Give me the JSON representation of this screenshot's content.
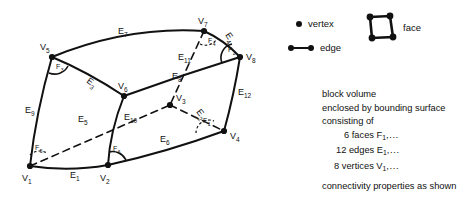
{
  "legend": {
    "vertex_label": "vertex",
    "edge_label": "edge",
    "face_label": "face",
    "vertex_icon": "filled-dot-icon",
    "edge_icon": "dot-line-dot-icon",
    "face_icon": "quadrilateral-face-icon"
  },
  "notes": {
    "line1": "block volume",
    "line2": "enclosed by bounding surface",
    "line3": "consisting of",
    "faces_count": "6 faces F",
    "faces_sub": "1",
    "faces_tail": ",...",
    "edges_count": "12 edges E",
    "edges_sub": "1",
    "edges_tail": ",...",
    "vertices_count": "8 vertices V",
    "vertices_sub": "1",
    "vertices_tail": ",...",
    "line_last": "connectivity properties as shown"
  },
  "diagram": {
    "vertices": [
      {
        "id": "V1",
        "base": "V",
        "sub": "1",
        "x": 30,
        "y": 166,
        "lx": 22,
        "ly": 181,
        "hidden": false
      },
      {
        "id": "V2",
        "base": "V",
        "sub": "2",
        "x": 108,
        "y": 165,
        "lx": 100,
        "ly": 181,
        "hidden": false
      },
      {
        "id": "V3",
        "base": "V",
        "sub": "3",
        "x": 170,
        "y": 105,
        "lx": 176,
        "ly": 101,
        "hidden": true
      },
      {
        "id": "V4",
        "base": "V",
        "sub": "4",
        "x": 224,
        "y": 131,
        "lx": 230,
        "ly": 139,
        "hidden": false
      },
      {
        "id": "V5",
        "base": "V",
        "sub": "5",
        "x": 52,
        "y": 57,
        "lx": 40,
        "ly": 50,
        "hidden": false
      },
      {
        "id": "V6",
        "base": "V",
        "sub": "6",
        "x": 124,
        "y": 96,
        "lx": 118,
        "ly": 89,
        "hidden": false
      },
      {
        "id": "V7",
        "base": "V",
        "sub": "7",
        "x": 204,
        "y": 31,
        "lx": 198,
        "ly": 24,
        "hidden": false
      },
      {
        "id": "V8",
        "base": "V",
        "sub": "8",
        "x": 240,
        "y": 57,
        "lx": 246,
        "ly": 60,
        "hidden": false
      }
    ],
    "edges": [
      {
        "id": "E1",
        "base": "E",
        "sub": "1",
        "from": "V1",
        "to": "V2",
        "dashed": false,
        "path": "M30,166 Q69,172 108,165",
        "lx": 70,
        "ly": 178,
        "rot": 0
      },
      {
        "id": "E2",
        "base": "E",
        "sub": "2",
        "from": "V3",
        "to": "V4",
        "dashed": true,
        "path": "M170,105 L224,131",
        "lx": 196,
        "ly": 112,
        "rot": 52
      },
      {
        "id": "E3",
        "base": "E",
        "sub": "3",
        "from": "V5",
        "to": "V6",
        "dashed": false,
        "path": "M52,57 Q88,72 124,96",
        "lx": 86,
        "ly": 82,
        "rot": 36
      },
      {
        "id": "E4",
        "base": "E",
        "sub": "4",
        "from": "V7",
        "to": "V8",
        "dashed": false,
        "path": "M204,31 Q224,40 240,57",
        "lx": 225,
        "ly": 35,
        "rot": 56
      },
      {
        "id": "E5",
        "base": "E",
        "sub": "5",
        "from": "V1",
        "to": "V3",
        "dashed": true,
        "path": "M30,166 L170,105",
        "lx": 78,
        "ly": 122,
        "rot": 0
      },
      {
        "id": "E6",
        "base": "E",
        "sub": "6",
        "from": "V2",
        "to": "V4",
        "dashed": false,
        "path": "M108,165 Q167,152 224,131",
        "lx": 160,
        "ly": 142,
        "rot": 0
      },
      {
        "id": "E7",
        "base": "E",
        "sub": "7",
        "from": "V5",
        "to": "V7",
        "dashed": false,
        "path": "M52,57 Q128,26 204,31",
        "lx": 118,
        "ly": 34,
        "rot": 0
      },
      {
        "id": "E8",
        "base": "E",
        "sub": "8",
        "from": "V6",
        "to": "V8",
        "dashed": false,
        "path": "M124,96 Q182,75 240,57",
        "lx": 172,
        "ly": 79,
        "rot": 0
      },
      {
        "id": "E9",
        "base": "E",
        "sub": "9",
        "from": "V5",
        "to": "V1",
        "dashed": false,
        "path": "M52,57 Q36,112 30,166",
        "lx": 25,
        "ly": 113,
        "rot": 0
      },
      {
        "id": "E10",
        "base": "E",
        "sub": "10",
        "from": "V6",
        "to": "V2",
        "dashed": false,
        "path": "M124,96 Q110,131 108,165",
        "lx": 124,
        "ly": 120,
        "rot": 0
      },
      {
        "id": "E11",
        "base": "E",
        "sub": "11",
        "from": "V7",
        "to": "V3",
        "dashed": true,
        "path": "M204,31 L170,105",
        "lx": 178,
        "ly": 60,
        "rot": 0
      },
      {
        "id": "E12",
        "base": "E",
        "sub": "12",
        "from": "V8",
        "to": "V4",
        "dashed": false,
        "path": "M240,57 Q234,95 224,131",
        "lx": 238,
        "ly": 95,
        "rot": 0
      }
    ],
    "faces": [
      {
        "id": "F1",
        "base": "F",
        "sub": "1",
        "at": "V4",
        "lx": 203,
        "ly": 123,
        "dashed": true,
        "arc": "M196,133 A13,13 0 0 1 214,121"
      },
      {
        "id": "F2",
        "base": "F",
        "sub": "2",
        "at": "V8",
        "lx": 228,
        "ly": 52,
        "dashed": false,
        "arc": "M222,63 A14,14 0 0 1 232,44"
      },
      {
        "id": "F3",
        "base": "F",
        "sub": "3",
        "at": "V5",
        "lx": 56,
        "ly": 69,
        "dashed": false,
        "arc": "M49,73 A15,15 0 0 0 68,66"
      },
      {
        "id": "F4",
        "base": "F",
        "sub": "4",
        "at": "V7",
        "lx": 208,
        "ly": 43,
        "dashed": true,
        "arc": "M200,44 A13,13 0 0 0 216,40"
      },
      {
        "id": "F5",
        "base": "F",
        "sub": "5",
        "at": "V1",
        "lx": 35,
        "ly": 150,
        "dashed": true,
        "arc": "M30,155 A14,14 0 0 1 47,153"
      },
      {
        "id": "F6",
        "base": "F",
        "sub": "6",
        "at": "V2",
        "lx": 113,
        "ly": 151,
        "dashed": false,
        "arc": "M109,152 A15,15 0 0 1 126,160"
      }
    ]
  }
}
